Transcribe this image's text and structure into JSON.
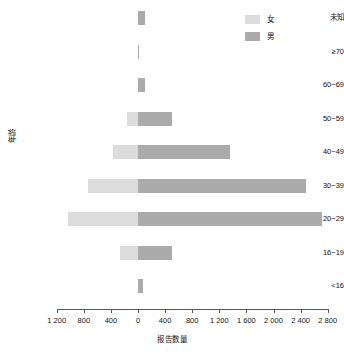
{
  "chart_data": {
    "type": "bar",
    "subtype": "population-pyramid",
    "title": "",
    "xlabel": "报告数量",
    "ylabel": "年龄",
    "orientation": "horizontal-diverging",
    "categories": [
      "未知",
      "≥70",
      "60~69",
      "50~59",
      "40~49",
      "30~39",
      "20~29",
      "16~19",
      "<16"
    ],
    "series": [
      {
        "name": "女",
        "color": "#dcdcdc",
        "direction": "left",
        "values": [
          0,
          0,
          0,
          162,
          369,
          740,
          1033,
          265,
          0
        ]
      },
      {
        "name": "男",
        "color": "#ababab",
        "direction": "right",
        "values": [
          100,
          10,
          100,
          502,
          1358,
          2480,
          2716,
          500,
          75
        ]
      }
    ],
    "x_ticks": [
      {
        "label": "1 200",
        "value": -1200
      },
      {
        "label": "800",
        "value": -800
      },
      {
        "label": "400",
        "value": -400
      },
      {
        "label": "0",
        "value": 0
      },
      {
        "label": "400",
        "value": 400
      },
      {
        "label": "800",
        "value": 800
      },
      {
        "label": "1 200",
        "value": 1200
      },
      {
        "label": "1 600",
        "value": 1600
      },
      {
        "label": "2 000",
        "value": 2000
      },
      {
        "label": "2 400",
        "value": 2400
      },
      {
        "label": "2 800",
        "value": 2800
      }
    ],
    "xlim": [
      -1200,
      2800
    ],
    "grid": false,
    "legend_position": "top-right"
  },
  "legend": {
    "items": [
      {
        "label": "女",
        "color": "#dcdcdc"
      },
      {
        "label": "男",
        "color": "#ababab"
      }
    ]
  },
  "axes": {
    "x_title": "报告数量",
    "y_title": "年龄"
  }
}
